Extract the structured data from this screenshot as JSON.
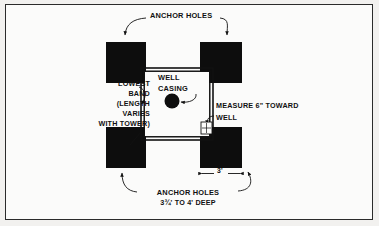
{
  "diagram": {
    "background_color": "#f2f1ef",
    "paper_color": "#fbfbfa",
    "ink_color": "#111111",
    "frame": {
      "border_color": "#2b2b2b"
    },
    "labels": {
      "anchor_holes_top": "ANCHOR HOLES",
      "lowest_band": "LOWEST\nBAND\n(LENGTH\nVARIES\nWITH TOWER)",
      "well_casing": "WELL\nCASING",
      "measure_toward_well": "MEASURE 6\" TOWARD\nWELL",
      "anchor_holes_bottom": "ANCHOR HOLES",
      "hole_depth": "3¾' TO 4' DEEP",
      "dimension_spacing": "3'"
    },
    "elements": {
      "anchor_hole_fill": "#0d0d0d",
      "anchor_hole_count": 4,
      "well_casing_shape": "filled-circle",
      "band_shape": "square-outline"
    }
  }
}
